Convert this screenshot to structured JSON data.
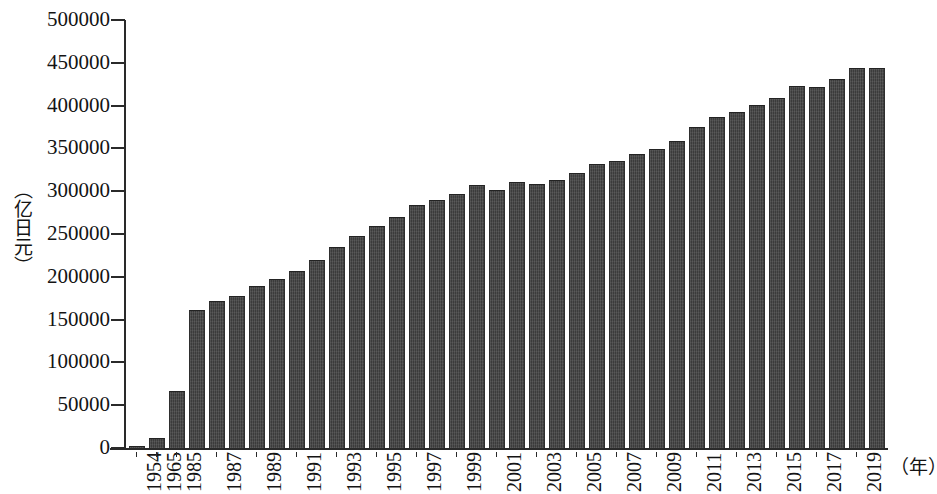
{
  "chart_data": {
    "type": "bar",
    "title": "",
    "subtitle": "",
    "xlabel": "（年）",
    "ylabel": "（亿日元）",
    "ylim": [
      0,
      500000
    ],
    "ytick_step": 50000,
    "grid": false,
    "legend": null,
    "bar_color": "#3b3b3b",
    "axis_color": "#2a2a2a",
    "yticks": [
      "500000",
      "450000",
      "400000",
      "350000",
      "300000",
      "250000",
      "200000",
      "150000",
      "100000",
      "50000",
      "0"
    ],
    "categories": [
      "1954",
      "1965",
      "1985",
      "1986",
      "1987",
      "1988",
      "1989",
      "1990",
      "1991",
      "1992",
      "1993",
      "1994",
      "1995",
      "1996",
      "1997",
      "1998",
      "1999",
      "2000",
      "2001",
      "2002",
      "2003",
      "2004",
      "2005",
      "2006",
      "2007",
      "2008",
      "2009",
      "2010",
      "2011",
      "2012",
      "2013",
      "2014",
      "2015",
      "2016",
      "2017",
      "2018",
      "2019",
      "2020"
    ],
    "tick_labels_shown": [
      "1954",
      "1965",
      "1985",
      "",
      "1987",
      "",
      "1989",
      "",
      "1991",
      "",
      "1993",
      "",
      "1995",
      "",
      "1997",
      "",
      "1999",
      "",
      "2001",
      "",
      "2003",
      "",
      "2005",
      "",
      "2007",
      "",
      "2009",
      "",
      "2011",
      "",
      "2013",
      "",
      "2015",
      "",
      "2017",
      "",
      "2019",
      ""
    ],
    "values": [
      1500,
      11000,
      65000,
      160000,
      171000,
      177000,
      188000,
      196000,
      206000,
      218000,
      234000,
      247000,
      258000,
      269000,
      283000,
      289000,
      295000,
      306000,
      300000,
      310000,
      307000,
      312000,
      320000,
      331000,
      334000,
      342000,
      348000,
      358000,
      374000,
      385000,
      391000,
      400000,
      408000,
      422000,
      421000,
      430000,
      443000,
      443000
    ]
  }
}
